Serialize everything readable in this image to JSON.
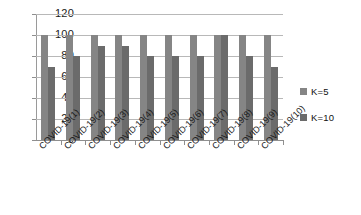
{
  "chart_data": {
    "type": "bar",
    "title": "",
    "xlabel": "",
    "ylabel": "",
    "ylim": [
      0,
      120
    ],
    "ytick_step": 20,
    "yticks": [
      120,
      100,
      80,
      60,
      40,
      20,
      0
    ],
    "grid": true,
    "legend_position": "right",
    "categories": [
      "COVID-19(1)",
      "COVID-19(2)",
      "COVID-19(3)",
      "COVID-19(4)",
      "COVID-19(5)",
      "COVID-19(6)",
      "COVID-19(7)",
      "COVID-19(8)",
      "COVID-19(9)",
      "COVID-19(10)"
    ],
    "series": [
      {
        "name": "K=5",
        "color": "#858585",
        "values": [
          100,
          100,
          100,
          100,
          100,
          100,
          100,
          100,
          100,
          100
        ]
      },
      {
        "name": "K=10",
        "color": "#6b6b6b",
        "values": [
          70,
          80,
          90,
          90,
          80,
          80,
          80,
          100,
          80,
          70
        ]
      }
    ]
  },
  "legend": {
    "items": [
      {
        "label": "K=5",
        "color": "#858585"
      },
      {
        "label": "K=10",
        "color": "#6b6b6b"
      }
    ]
  }
}
